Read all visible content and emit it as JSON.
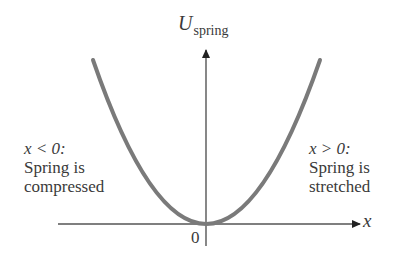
{
  "diagram": {
    "type": "potential-energy-graph",
    "y_axis": {
      "label_main": "U",
      "label_sub": "spring"
    },
    "x_axis": {
      "label": "x"
    },
    "origin_label": "0",
    "curve": {
      "shape": "parabola",
      "color": "#7a7a7a"
    },
    "axis_color": "#555555",
    "left_annotation": {
      "condition": "x < 0:",
      "line1": "Spring is",
      "line2": "compressed"
    },
    "right_annotation": {
      "condition": "x > 0:",
      "line1": "Spring is",
      "line2": "stretched"
    }
  }
}
